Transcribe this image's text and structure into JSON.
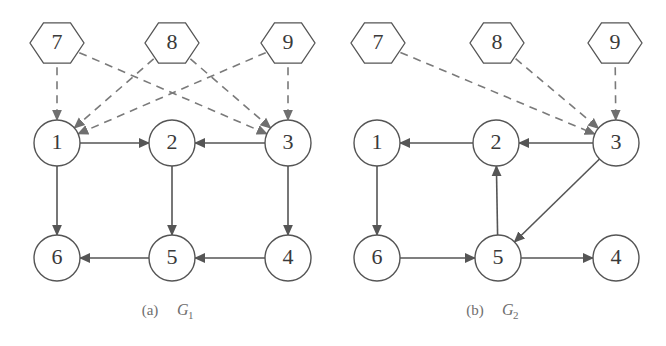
{
  "figure": {
    "background_color": "#ffffff",
    "stroke_color": "#555555",
    "dashed_stroke_color": "#7a7a7a",
    "label_color": "#3a3a3a",
    "caption_color": "#6e6e6e",
    "width": 666,
    "height": 346
  },
  "graphs": [
    {
      "id": "graph-a",
      "caption_prefix": "(a)",
      "caption_symbol": "G",
      "caption_subscript": "1",
      "caption_x": 172,
      "caption_y": 315,
      "nodes": [
        {
          "id": "a7",
          "label": "7",
          "shape": "hexagon",
          "cx": 57,
          "cy": 43,
          "r": 27
        },
        {
          "id": "a8",
          "label": "8",
          "shape": "hexagon",
          "cx": 172,
          "cy": 43,
          "r": 27
        },
        {
          "id": "a9",
          "label": "9",
          "shape": "hexagon",
          "cx": 288,
          "cy": 43,
          "r": 27
        },
        {
          "id": "a1",
          "label": "1",
          "shape": "circle",
          "cx": 57,
          "cy": 143,
          "r": 23
        },
        {
          "id": "a2",
          "label": "2",
          "shape": "circle",
          "cx": 172,
          "cy": 143,
          "r": 23
        },
        {
          "id": "a3",
          "label": "3",
          "shape": "circle",
          "cx": 288,
          "cy": 143,
          "r": 23
        },
        {
          "id": "a6",
          "label": "6",
          "shape": "circle",
          "cx": 57,
          "cy": 258,
          "r": 23
        },
        {
          "id": "a5",
          "label": "5",
          "shape": "circle",
          "cx": 172,
          "cy": 258,
          "r": 23
        },
        {
          "id": "a4",
          "label": "4",
          "shape": "circle",
          "cx": 288,
          "cy": 258,
          "r": 23
        }
      ],
      "edges": [
        {
          "from": "a7",
          "to": "a1",
          "style": "dashed"
        },
        {
          "from": "a7",
          "to": "a3",
          "style": "dashed"
        },
        {
          "from": "a8",
          "to": "a1",
          "style": "dashed"
        },
        {
          "from": "a8",
          "to": "a3",
          "style": "dashed"
        },
        {
          "from": "a9",
          "to": "a1",
          "style": "dashed"
        },
        {
          "from": "a9",
          "to": "a3",
          "style": "dashed"
        },
        {
          "from": "a1",
          "to": "a2",
          "style": "solid"
        },
        {
          "from": "a3",
          "to": "a2",
          "style": "solid"
        },
        {
          "from": "a1",
          "to": "a6",
          "style": "solid"
        },
        {
          "from": "a2",
          "to": "a5",
          "style": "solid"
        },
        {
          "from": "a3",
          "to": "a4",
          "style": "solid"
        },
        {
          "from": "a5",
          "to": "a6",
          "style": "solid"
        },
        {
          "from": "a4",
          "to": "a5",
          "style": "solid"
        }
      ]
    },
    {
      "id": "graph-b",
      "caption_prefix": "(b)",
      "caption_symbol": "G",
      "caption_subscript": "2",
      "caption_x": 497,
      "caption_y": 315,
      "nodes": [
        {
          "id": "b7",
          "label": "7",
          "shape": "hexagon",
          "cx": 378,
          "cy": 43,
          "r": 27
        },
        {
          "id": "b8",
          "label": "8",
          "shape": "hexagon",
          "cx": 497,
          "cy": 43,
          "r": 27
        },
        {
          "id": "b9",
          "label": "9",
          "shape": "hexagon",
          "cx": 615,
          "cy": 43,
          "r": 27
        },
        {
          "id": "b1",
          "label": "1",
          "shape": "circle",
          "cx": 377,
          "cy": 143,
          "r": 23
        },
        {
          "id": "b2",
          "label": "2",
          "shape": "circle",
          "cx": 496,
          "cy": 143,
          "r": 23
        },
        {
          "id": "b3",
          "label": "3",
          "shape": "circle",
          "cx": 616,
          "cy": 143,
          "r": 23
        },
        {
          "id": "b6",
          "label": "6",
          "shape": "circle",
          "cx": 377,
          "cy": 258,
          "r": 23
        },
        {
          "id": "b5",
          "label": "5",
          "shape": "circle",
          "cx": 498,
          "cy": 258,
          "r": 23
        },
        {
          "id": "b4",
          "label": "4",
          "shape": "circle",
          "cx": 616,
          "cy": 258,
          "r": 23
        }
      ],
      "edges": [
        {
          "from": "b7",
          "to": "b3",
          "style": "dashed"
        },
        {
          "from": "b8",
          "to": "b3",
          "style": "dashed"
        },
        {
          "from": "b9",
          "to": "b3",
          "style": "dashed"
        },
        {
          "from": "b3",
          "to": "b2",
          "style": "solid"
        },
        {
          "from": "b2",
          "to": "b1",
          "style": "solid"
        },
        {
          "from": "b1",
          "to": "b6",
          "style": "solid"
        },
        {
          "from": "b6",
          "to": "b5",
          "style": "solid"
        },
        {
          "from": "b5",
          "to": "b2",
          "style": "solid"
        },
        {
          "from": "b3",
          "to": "b5",
          "style": "solid"
        },
        {
          "from": "b5",
          "to": "b4",
          "style": "solid"
        }
      ]
    }
  ]
}
